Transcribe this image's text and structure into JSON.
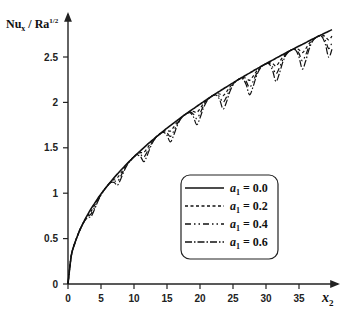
{
  "chart_data": {
    "type": "line",
    "title": "",
    "xlabel": "x_2",
    "ylabel": "Nu_x / Ra^1/2",
    "ylabel_parts": {
      "main": "Nu",
      "sub": "x",
      "mid": " / Ra",
      "sup": "1/2"
    },
    "xlabel_parts": {
      "main": "x",
      "sub": "2"
    },
    "xlim": [
      0,
      40
    ],
    "ylim": [
      0,
      2.8
    ],
    "xticks": [
      0,
      5,
      10,
      15,
      20,
      25,
      30,
      35
    ],
    "xtick_labels": [
      "0",
      "5",
      "10",
      "15",
      "20",
      "25",
      "30",
      "35"
    ],
    "yticks": [
      0,
      0.5,
      1,
      1.5,
      2,
      2.5
    ],
    "ytick_labels": [
      "0",
      "0.5",
      "1",
      "1.5",
      "2",
      "2.5"
    ],
    "grid": false,
    "legend_position": "lower right (inside)",
    "x": [
      0,
      0.5,
      1,
      1.5,
      2,
      2.5,
      3,
      3.5,
      4,
      4.5,
      5,
      5.5,
      6,
      6.5,
      7,
      7.5,
      8,
      8.5,
      9,
      9.5,
      10,
      10.5,
      11,
      11.5,
      12,
      12.5,
      13,
      13.5,
      14,
      14.5,
      15,
      15.5,
      16,
      16.5,
      17,
      17.5,
      18,
      18.5,
      19,
      19.5,
      20,
      20.5,
      21,
      21.5,
      22,
      22.5,
      23,
      23.5,
      24,
      24.5,
      25,
      25.5,
      26,
      26.5,
      27,
      27.5,
      28,
      28.5,
      29,
      29.5,
      30,
      30.5,
      31,
      31.5,
      32,
      32.5,
      33,
      33.5,
      34,
      34.5,
      35,
      35.5,
      36,
      36.5,
      37,
      37.5,
      38,
      38.5,
      39,
      39.5,
      40
    ],
    "base_values": [
      0,
      0.313,
      0.443,
      0.543,
      0.627,
      0.7,
      0.767,
      0.829,
      0.886,
      0.94,
      0.991,
      1.039,
      1.085,
      1.129,
      1.172,
      1.213,
      1.253,
      1.292,
      1.329,
      1.365,
      1.401,
      1.435,
      1.469,
      1.502,
      1.535,
      1.566,
      1.597,
      1.628,
      1.658,
      1.687,
      1.716,
      1.744,
      1.772,
      1.8,
      1.827,
      1.853,
      1.879,
      1.905,
      1.931,
      1.956,
      1.981,
      2.006,
      2.03,
      2.054,
      2.078,
      2.101,
      2.125,
      2.148,
      2.17,
      2.193,
      2.215,
      2.237,
      2.259,
      2.28,
      2.302,
      2.323,
      2.344,
      2.365,
      2.386,
      2.406,
      2.426,
      2.447,
      2.466,
      2.486,
      2.506,
      2.525,
      2.545,
      2.564,
      2.583,
      2.602,
      2.621,
      2.639,
      2.658,
      2.676,
      2.695,
      2.713,
      2.731,
      2.749,
      2.767,
      2.784,
      2.802
    ],
    "dip_profile_period": 4,
    "dip_profile": [
      0.75,
      0.35,
      0.1,
      0,
      0,
      0.1,
      0.45,
      1.0
    ],
    "dip_coefficient": 0.076,
    "dip_start_x": 1.5,
    "series": [
      {
        "name": "a1 = 0.0",
        "a1": 0.0,
        "dash": "",
        "minima_approx": []
      },
      {
        "name": "a1 = 0.2",
        "a1": 0.2,
        "dash": "3,2.5",
        "minima_approx": [
          [
            11.5,
            1.45
          ],
          [
            19.5,
            1.89
          ],
          [
            27.5,
            2.24
          ],
          [
            35.5,
            2.55
          ],
          [
            39.5,
            2.69
          ]
        ]
      },
      {
        "name": "a1 = 0.4",
        "a1": 0.4,
        "dash": "6,3,1.5,3,1.5,3",
        "minima_approx": [
          [
            11.5,
            1.4
          ],
          [
            19.5,
            1.82
          ],
          [
            27.5,
            2.16
          ],
          [
            35.5,
            2.46
          ],
          [
            39.5,
            2.59
          ]
        ]
      },
      {
        "name": "a1 = 0.6",
        "a1": 0.6,
        "dash": "7,2,1.5,2",
        "minima_approx": [
          [
            11.5,
            1.35
          ],
          [
            19.5,
            1.75
          ],
          [
            27.5,
            2.08
          ],
          [
            35.5,
            2.37
          ],
          [
            39.5,
            2.5
          ]
        ]
      }
    ]
  },
  "legend": {
    "items": [
      {
        "symbol": "a",
        "sub": "1",
        "rest": " = 0.0"
      },
      {
        "symbol": "a",
        "sub": "1",
        "rest": " = 0.2"
      },
      {
        "symbol": "a",
        "sub": "1",
        "rest": " = 0.4"
      },
      {
        "symbol": "a",
        "sub": "1",
        "rest": " = 0.6"
      }
    ]
  },
  "colors": {
    "line": "#111111",
    "axis": "#222222",
    "background": "#ffffff"
  }
}
